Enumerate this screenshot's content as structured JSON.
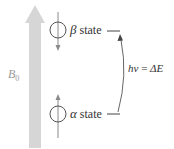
{
  "figure": {
    "field_label": {
      "symbol": "B",
      "subscript": "0"
    },
    "states": [
      {
        "greek": "β",
        "label": "state",
        "spin": "down",
        "level": "upper"
      },
      {
        "greek": "α",
        "label": "state",
        "spin": "up",
        "level": "lower"
      }
    ],
    "transition": {
      "lhs": "hν",
      "equals": "=",
      "rhs": "ΔE"
    },
    "colors": {
      "field_arrow": "#d4d4d4",
      "lines": "#555555",
      "spin_axis": "#888888",
      "text": "#333333",
      "field_label": "#9a9a9a"
    }
  }
}
